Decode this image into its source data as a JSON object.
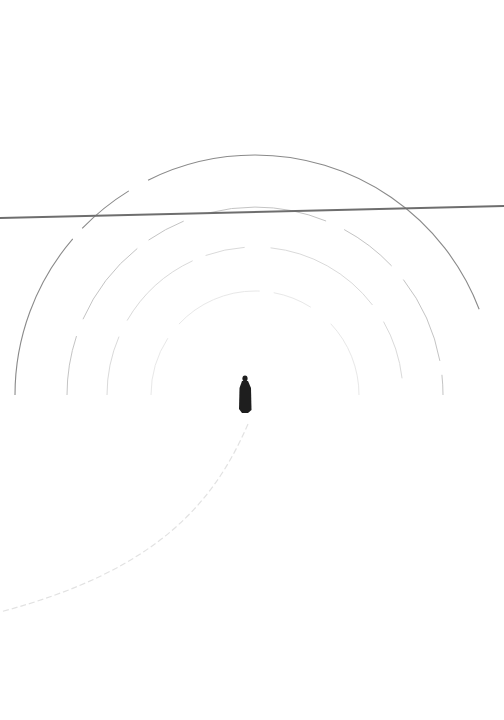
{
  "scene": {
    "description": "Minimalist high-key photograph: lone dark-clad figure standing in white snow, surrounded by concentric faint arcs, a thin dark horizontal cable crossing the upper area, and a faint curved track trailing to the lower left.",
    "background_color": "#ffffff",
    "figure": {
      "x": 245,
      "y_top": 376,
      "y_bottom": 413,
      "color": "#1e1e1e"
    },
    "cable": {
      "x1": 0,
      "y1": 218,
      "x2": 504,
      "y2": 206,
      "color": "#6e6e6e",
      "width": 2
    },
    "arcs": [
      {
        "name": "outer-arc",
        "cx": 255,
        "cy": 395,
        "r": 240,
        "color": "#8a8a8a",
        "width": 1.1
      },
      {
        "name": "arc-2",
        "cx": 255,
        "cy": 395,
        "r": 188,
        "color": "#c4c4c4",
        "width": 1
      },
      {
        "name": "arc-3",
        "cx": 255,
        "cy": 395,
        "r": 148,
        "color": "#dadada",
        "width": 1
      },
      {
        "name": "arc-4",
        "cx": 255,
        "cy": 395,
        "r": 104,
        "color": "#e8e8e8",
        "width": 1
      }
    ],
    "track": {
      "d": "M 248 424 C 215 500, 160 570, 0 612",
      "color": "#e2e2e2",
      "width": 1.2
    }
  }
}
